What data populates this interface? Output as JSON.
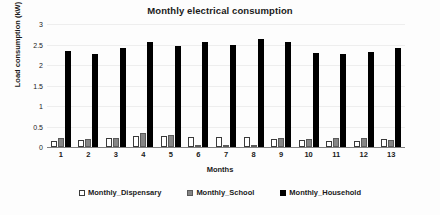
{
  "chart_data": {
    "type": "bar",
    "title": "Monthly electrical consumption",
    "xlabel": "Months",
    "ylabel": "Load consumption (kW)",
    "categories": [
      "1",
      "2",
      "3",
      "4",
      "5",
      "6",
      "7",
      "8",
      "9",
      "10",
      "11",
      "12",
      "13"
    ],
    "ylim": [
      0,
      3
    ],
    "yticks": [
      "0",
      "0.5",
      "1",
      "1.5",
      "2",
      "2.5",
      "3"
    ],
    "grid": true,
    "legend_position": "bottom",
    "series": [
      {
        "name": "Monthly_Dispensary",
        "color": "#ffffff",
        "values": [
          0.14,
          0.17,
          0.22,
          0.28,
          0.26,
          0.24,
          0.25,
          0.25,
          0.2,
          0.17,
          0.15,
          0.14,
          0.19
        ]
      },
      {
        "name": "Monthly_School",
        "color": "#858585",
        "values": [
          0.22,
          0.2,
          0.22,
          0.33,
          0.3,
          0.05,
          0.04,
          0.05,
          0.21,
          0.19,
          0.21,
          0.22,
          0.17
        ]
      },
      {
        "name": "Monthly_Household",
        "color": "#000000",
        "values": [
          2.33,
          2.27,
          2.42,
          2.55,
          2.46,
          2.55,
          2.48,
          2.63,
          2.55,
          2.3,
          2.28,
          2.31,
          2.41
        ]
      }
    ]
  }
}
